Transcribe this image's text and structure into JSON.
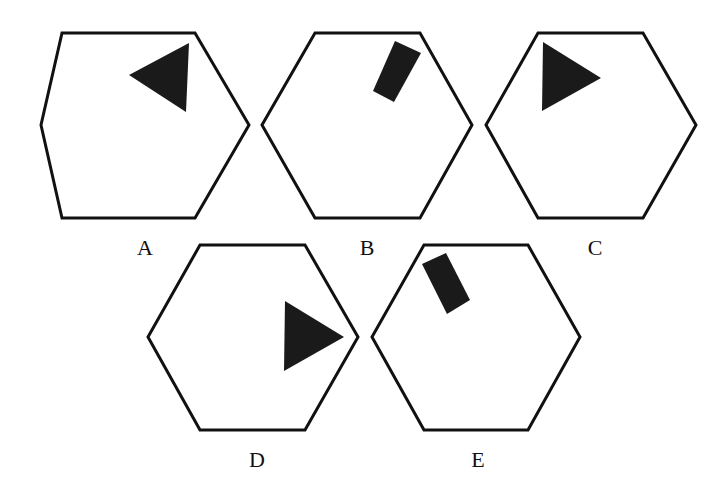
{
  "colors": {
    "stroke": "#111111",
    "fill": "#1a1a1a",
    "background": "#ffffff"
  },
  "options": [
    {
      "label": "A",
      "label_pos": [
        145,
        248
      ],
      "hexagon": [
        [
          62,
          33
        ],
        [
          195,
          33
        ],
        [
          249,
          125
        ],
        [
          195,
          218
        ],
        [
          62,
          218
        ],
        [
          41,
          125
        ]
      ],
      "shape": {
        "type": "triangle",
        "points": [
          [
            129,
            75
          ],
          [
            189,
            43
          ],
          [
            186,
            112
          ]
        ]
      }
    },
    {
      "label": "B",
      "label_pos": [
        367,
        248
      ],
      "hexagon": [
        [
          315,
          33
        ],
        [
          420,
          33
        ],
        [
          472,
          125
        ],
        [
          420,
          218
        ],
        [
          315,
          218
        ],
        [
          262,
          125
        ]
      ],
      "shape": {
        "type": "rectangle",
        "points": [
          [
            395,
            41
          ],
          [
            421,
            53
          ],
          [
            394,
            102
          ],
          [
            373,
            91
          ]
        ]
      }
    },
    {
      "label": "C",
      "label_pos": [
        595,
        248
      ],
      "hexagon": [
        [
          538,
          33
        ],
        [
          643,
          33
        ],
        [
          696,
          125
        ],
        [
          643,
          218
        ],
        [
          538,
          218
        ],
        [
          486,
          125
        ]
      ],
      "shape": {
        "type": "triangle",
        "points": [
          [
            543,
            42
          ],
          [
            601,
            78
          ],
          [
            542,
            111
          ]
        ]
      }
    },
    {
      "label": "D",
      "label_pos": [
        257,
        460
      ],
      "hexagon": [
        [
          200,
          245
        ],
        [
          305,
          245
        ],
        [
          358,
          337
        ],
        [
          305,
          430
        ],
        [
          200,
          430
        ],
        [
          148,
          337
        ]
      ],
      "shape": {
        "type": "triangle",
        "points": [
          [
            285,
            301
          ],
          [
            344,
            337
          ],
          [
            284,
            371
          ]
        ]
      }
    },
    {
      "label": "E",
      "label_pos": [
        478,
        460
      ],
      "hexagon": [
        [
          424,
          245
        ],
        [
          528,
          245
        ],
        [
          580,
          337
        ],
        [
          528,
          430
        ],
        [
          424,
          430
        ],
        [
          372,
          337
        ]
      ],
      "shape": {
        "type": "rectangle",
        "points": [
          [
            422,
            264
          ],
          [
            446,
            253
          ],
          [
            470,
            300
          ],
          [
            447,
            314
          ]
        ]
      }
    }
  ]
}
